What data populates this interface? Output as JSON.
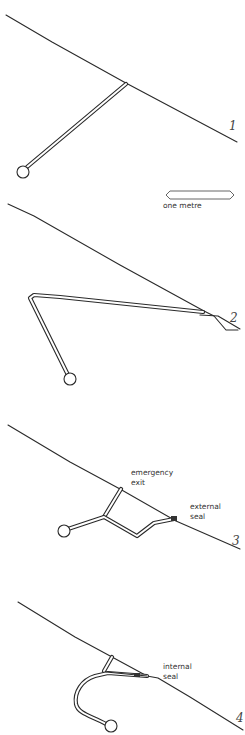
{
  "figures": [
    {
      "number": "1",
      "labels": []
    },
    {
      "number": "2",
      "labels": []
    },
    {
      "number": "3",
      "labels": [
        "emergency",
        "exit",
        "external",
        "seal"
      ]
    },
    {
      "number": "4",
      "labels": [
        "internal",
        "seal"
      ]
    }
  ],
  "scale_bar": {
    "label": "one metre"
  },
  "colors": {
    "line": "#2a2a2a",
    "background": "#ffffff"
  }
}
